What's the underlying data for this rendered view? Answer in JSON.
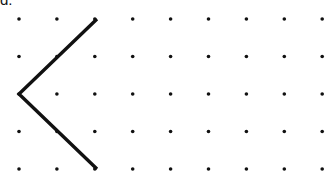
{
  "canvas": {
    "width": 336,
    "height": 181,
    "background_color": "#ffffff"
  },
  "label": {
    "text": "d.",
    "color": "#111111",
    "clipped_top": true
  },
  "figure": {
    "kind": "dot-grid-geometry-figure",
    "grid": {
      "columns": 9,
      "rows": 5,
      "origin_x": 19,
      "origin_y": 19,
      "spacing_x": 37.9,
      "spacing_y": 37.5,
      "dot_radius": 1.8,
      "dot_color": "#111111"
    },
    "shape": {
      "name": "chevron-left",
      "stroke_color": "#111111",
      "stroke_width": 3.4,
      "closed": false,
      "points": [
        {
          "col": 2,
          "row": 0,
          "x": 97,
          "y": 19
        },
        {
          "col": 0,
          "row": 2,
          "x": 19,
          "y": 94
        },
        {
          "col": 2,
          "row": 4,
          "x": 97,
          "y": 169
        }
      ]
    },
    "covered_dots": [
      {
        "col": 2,
        "row": 0
      },
      {
        "col": 0,
        "row": 2
      },
      {
        "col": 2,
        "row": 4
      }
    ]
  }
}
